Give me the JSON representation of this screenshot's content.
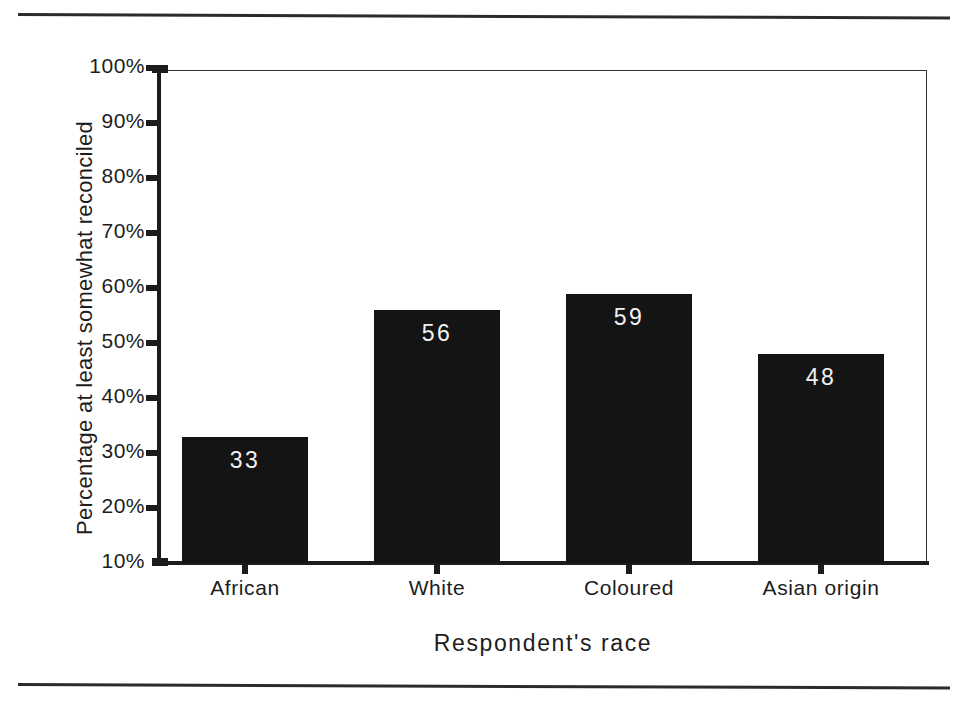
{
  "chart_data": {
    "type": "bar",
    "title": "",
    "subtitle": "",
    "xlabel": "Respondent's race",
    "ylabel": "Percentage at least somewhat reconciled",
    "categories": [
      "African",
      "White",
      "Coloured",
      "Asian origin"
    ],
    "values": [
      33,
      56,
      59,
      48
    ],
    "data_labels": [
      "33",
      "56",
      "59",
      "48"
    ],
    "ylim": [
      10,
      100
    ],
    "ytick_labels": [
      "100%",
      "90%",
      "80%",
      "70%",
      "60%",
      "50%",
      "40%",
      "30%",
      "20%",
      "10%"
    ],
    "ytick_values": [
      100,
      90,
      80,
      70,
      60,
      50,
      40,
      30,
      20,
      10
    ],
    "grid": false,
    "legend": null,
    "legend_position": "none",
    "bar_color": "#141414",
    "data_label_color": "#f2f2f2",
    "axis_color": "#1c1c1c",
    "background_color": "#ffffff"
  },
  "figure": {
    "top_rule": "horizontal-rule",
    "bottom_rule": "horizontal-rule"
  }
}
